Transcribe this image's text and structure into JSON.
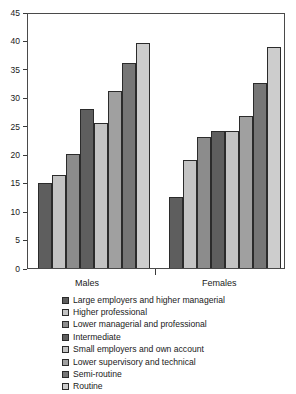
{
  "chart_data": {
    "type": "bar",
    "title": "",
    "xlabel": "",
    "ylabel": "",
    "categories": [
      "Males",
      "Females"
    ],
    "ylim": [
      0,
      45
    ],
    "yticks": [
      0,
      5,
      10,
      15,
      20,
      25,
      30,
      35,
      40,
      45
    ],
    "ytick_labels": [
      "0",
      "5",
      "10",
      "15",
      "20",
      "25",
      "30",
      "35",
      "40",
      "45"
    ],
    "grid": false,
    "legend_position": "bottom",
    "series": [
      {
        "name": "Large employers and higher managerial",
        "color": "#5e5e5e",
        "values": [
          15.0,
          12.4
        ]
      },
      {
        "name": "Higher professional",
        "color": "#c3c3c3",
        "values": [
          16.4,
          18.9
        ]
      },
      {
        "name": "Lower managerial and professional",
        "color": "#8c8c8c",
        "values": [
          20.0,
          23.1
        ]
      },
      {
        "name": "Intermediate",
        "color": "#5e5e5e",
        "values": [
          27.9,
          24.1
        ]
      },
      {
        "name": "Small employers and own account",
        "color": "#c3c3c3",
        "values": [
          25.5,
          24.1
        ]
      },
      {
        "name": "Lower supervisory and technical",
        "color": "#a0a0a0",
        "values": [
          31.2,
          26.8
        ]
      },
      {
        "name": "Semi-routine",
        "color": "#767676",
        "values": [
          36.1,
          32.5
        ]
      },
      {
        "name": "Routine",
        "color": "#cdcdcd",
        "values": [
          39.6,
          38.8
        ]
      }
    ]
  },
  "axis": {
    "y_max_label": "45",
    "y_min_label": "0"
  },
  "legend": {
    "items": [
      "Large employers and higher managerial",
      "Higher professional",
      "Lower managerial and professional",
      "Intermediate",
      "Small employers and own account",
      "Lower supervisory and technical",
      "Semi-routine",
      "Routine"
    ]
  }
}
